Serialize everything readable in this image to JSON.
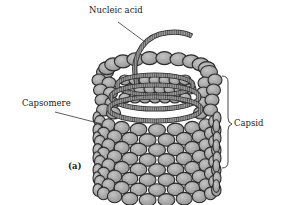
{
  "figure": {
    "panel_label": "(a)",
    "labels": {
      "nucleic_acid": "Nucleic acid",
      "capsomere": "Capsomere",
      "capsid": "Capsid"
    },
    "colors": {
      "capsomere_fill": "#a8a8a8",
      "capsomere_stroke": "#2a2a2a",
      "helix_fill": "#8a8a8a",
      "text": "#222222",
      "background": "#ffffff"
    }
  }
}
